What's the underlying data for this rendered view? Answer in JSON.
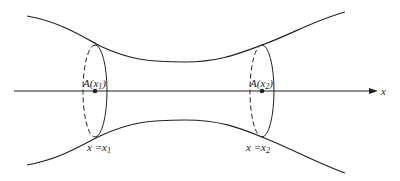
{
  "diagram": {
    "axis": {
      "label": "x"
    },
    "sections": [
      {
        "point_label": "A(x",
        "point_sub": "1",
        "point_close": ")",
        "position_label": "x =x",
        "position_sub": "1"
      },
      {
        "point_label": "A(x",
        "point_sub": "2",
        "point_close": ")",
        "position_label": "x =x",
        "position_sub": "2"
      }
    ]
  },
  "colors": {
    "stroke": "#222222",
    "background": "#ffffff"
  }
}
